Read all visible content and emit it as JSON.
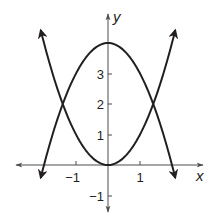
{
  "chart_data": {
    "type": "line",
    "title": "",
    "xlabel": "x",
    "ylabel": "y",
    "xlim": [
      -2.2,
      2.4
    ],
    "ylim": [
      -1.3,
      4.6
    ],
    "grid": false,
    "x_ticks": [
      -1,
      1
    ],
    "x_tick_labels": [
      "−1",
      "1"
    ],
    "y_ticks": [
      -1,
      1,
      2,
      3
    ],
    "y_tick_labels": [
      "−1",
      "1",
      "2",
      "3"
    ],
    "series": [
      {
        "name": "upward parabola",
        "equation": "y = x^2",
        "x_range": [
          -2.1,
          2.1
        ],
        "vertex": [
          0,
          0
        ]
      },
      {
        "name": "downward parabola",
        "equation": "y = 4 - x^2",
        "x_range": [
          -2.1,
          2.1
        ],
        "vertex": [
          0,
          4
        ]
      }
    ],
    "intersections": [
      [
        -1.41,
        2
      ],
      [
        1.41,
        2
      ]
    ],
    "colors": {
      "ink": "#231f20",
      "axis": "#4d4d4d"
    }
  }
}
